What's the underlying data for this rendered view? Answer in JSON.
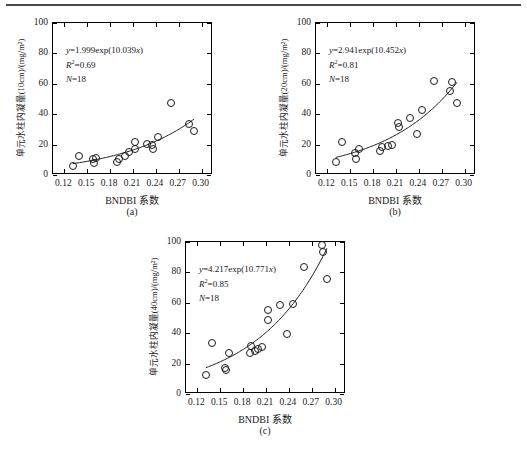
{
  "figure": {
    "background": "#ffffff",
    "marker_color": "#1a1a1a",
    "curve_color": "#1a1a1a",
    "axis_color": "#000000",
    "rule_color": "#4a4a4a"
  },
  "shared": {
    "xlabel": "BNDBI 系数",
    "xticks": [
      "0.12",
      "0.15",
      "0.18",
      "0.21",
      "0.24",
      "0.27",
      "0.30"
    ],
    "yticks": [
      "0",
      "20",
      "40",
      "60",
      "80",
      "100"
    ],
    "xlim": [
      0.105,
      0.315
    ],
    "ylim": [
      0,
      100
    ],
    "n_label": "N=18"
  },
  "panels": [
    {
      "tag": "(a)",
      "ylabel": "单元水柱内凝量(10cm)/(mg/m²)",
      "equation": "y=1.999exp(10.039x)",
      "eq_y": "y",
      "eq_rest": "=1.999exp(10.039",
      "eq_xclose": "x)",
      "r2_label": "R",
      "r2_value": "=0.69",
      "n": "N=18",
      "chart_data": {
        "type": "scatter",
        "title": "(a)",
        "xlabel": "BNDBI 系数",
        "ylabel": "单元水柱内凝量(10cm)/(mg/m²)",
        "xlim": [
          0.105,
          0.315
        ],
        "ylim": [
          0,
          100
        ],
        "xticks": [
          0.12,
          0.15,
          0.18,
          0.21,
          0.24,
          0.27,
          0.3
        ],
        "yticks": [
          0,
          20,
          40,
          60,
          80,
          100
        ],
        "grid": false,
        "legend": "none",
        "fit": {
          "form": "y=a*exp(b*x)",
          "a": 1.999,
          "b": 10.039,
          "r2": 0.69,
          "n": 18
        },
        "annotations": [
          "y=1.999exp(10.039x)",
          "R²=0.69",
          "N=18"
        ],
        "points": [
          {
            "x": 0.131,
            "y": 6.0
          },
          {
            "x": 0.139,
            "y": 12.3
          },
          {
            "x": 0.157,
            "y": 10.8
          },
          {
            "x": 0.159,
            "y": 7.8
          },
          {
            "x": 0.161,
            "y": 11.0
          },
          {
            "x": 0.189,
            "y": 8.6
          },
          {
            "x": 0.191,
            "y": 10.8
          },
          {
            "x": 0.199,
            "y": 12.2
          },
          {
            "x": 0.205,
            "y": 15.3
          },
          {
            "x": 0.212,
            "y": 21.5
          },
          {
            "x": 0.213,
            "y": 17.3
          },
          {
            "x": 0.228,
            "y": 20.4
          },
          {
            "x": 0.235,
            "y": 20.0
          },
          {
            "x": 0.236,
            "y": 17.2
          },
          {
            "x": 0.243,
            "y": 24.8
          },
          {
            "x": 0.26,
            "y": 47.3
          },
          {
            "x": 0.283,
            "y": 33.4
          },
          {
            "x": 0.29,
            "y": 29.2
          }
        ]
      }
    },
    {
      "tag": "(b)",
      "ylabel": "单元水柱内凝量(20cm)/(mg/m²)",
      "equation": "y=2.941exp(10.452x)",
      "eq_y": "y",
      "eq_rest": "=2.941exp(10.452",
      "eq_xclose": "x)",
      "r2_label": "R",
      "r2_value": "=0.81",
      "n": "N=18",
      "chart_data": {
        "type": "scatter",
        "title": "(b)",
        "xlabel": "BNDBI 系数",
        "ylabel": "单元水柱内凝量(20cm)/(mg/m²)",
        "xlim": [
          0.105,
          0.315
        ],
        "ylim": [
          0,
          100
        ],
        "xticks": [
          0.12,
          0.15,
          0.18,
          0.21,
          0.24,
          0.27,
          0.3
        ],
        "yticks": [
          0,
          20,
          40,
          60,
          80,
          100
        ],
        "grid": false,
        "legend": "none",
        "fit": {
          "form": "y=a*exp(b*x)",
          "a": 2.941,
          "b": 10.452,
          "r2": 0.81,
          "n": 18
        },
        "annotations": [
          "y=2.941exp(10.452x)",
          "R²=0.81",
          "N=18"
        ],
        "points": [
          {
            "x": 0.131,
            "y": 8.5
          },
          {
            "x": 0.139,
            "y": 21.7
          },
          {
            "x": 0.156,
            "y": 14.6
          },
          {
            "x": 0.158,
            "y": 10.6
          },
          {
            "x": 0.161,
            "y": 17.2
          },
          {
            "x": 0.189,
            "y": 15.8
          },
          {
            "x": 0.191,
            "y": 18.6
          },
          {
            "x": 0.199,
            "y": 19.4
          },
          {
            "x": 0.205,
            "y": 20.0
          },
          {
            "x": 0.212,
            "y": 34.2
          },
          {
            "x": 0.214,
            "y": 31.7
          },
          {
            "x": 0.229,
            "y": 37.2
          },
          {
            "x": 0.238,
            "y": 27.2
          },
          {
            "x": 0.244,
            "y": 42.7
          },
          {
            "x": 0.26,
            "y": 62.0
          },
          {
            "x": 0.281,
            "y": 55.0
          },
          {
            "x": 0.283,
            "y": 61.0
          },
          {
            "x": 0.29,
            "y": 47.6
          }
        ]
      }
    },
    {
      "tag": "(c)",
      "ylabel": "单元水柱内凝量(40cm)/(mg/m²)",
      "equation": "y=4.217exp(10.771x)",
      "eq_y": "y",
      "eq_rest": "=4.217exp(10.771",
      "eq_xclose": "x)",
      "r2_label": "R",
      "r2_value": "=0.85",
      "n": "N=18",
      "chart_data": {
        "type": "scatter",
        "title": "(c)",
        "xlabel": "BNDBI 系数",
        "ylabel": "单元水柱内凝量(40cm)/(mg/m²)",
        "xlim": [
          0.105,
          0.315
        ],
        "ylim": [
          0,
          100
        ],
        "xticks": [
          0.12,
          0.15,
          0.18,
          0.21,
          0.24,
          0.27,
          0.3
        ],
        "yticks": [
          0,
          20,
          40,
          60,
          80,
          100
        ],
        "grid": false,
        "legend": "none",
        "fit": {
          "form": "y=a*exp(b*x)",
          "a": 4.217,
          "b": 10.771,
          "r2": 0.85,
          "n": 18
        },
        "annotations": [
          "y=4.217exp(10.771x)",
          "R²=0.85",
          "N=18"
        ],
        "points": [
          {
            "x": 0.131,
            "y": 12.7
          },
          {
            "x": 0.139,
            "y": 33.8
          },
          {
            "x": 0.156,
            "y": 17.0
          },
          {
            "x": 0.158,
            "y": 15.8
          },
          {
            "x": 0.162,
            "y": 26.8
          },
          {
            "x": 0.189,
            "y": 27.0
          },
          {
            "x": 0.19,
            "y": 31.8
          },
          {
            "x": 0.196,
            "y": 28.0
          },
          {
            "x": 0.199,
            "y": 29.6
          },
          {
            "x": 0.205,
            "y": 30.8
          },
          {
            "x": 0.212,
            "y": 55.0
          },
          {
            "x": 0.213,
            "y": 49.0
          },
          {
            "x": 0.228,
            "y": 58.6
          },
          {
            "x": 0.238,
            "y": 39.2
          },
          {
            "x": 0.245,
            "y": 59.2
          },
          {
            "x": 0.26,
            "y": 83.8
          },
          {
            "x": 0.283,
            "y": 98.0
          },
          {
            "x": 0.285,
            "y": 93.5
          },
          {
            "x": 0.29,
            "y": 75.6
          }
        ]
      }
    }
  ]
}
